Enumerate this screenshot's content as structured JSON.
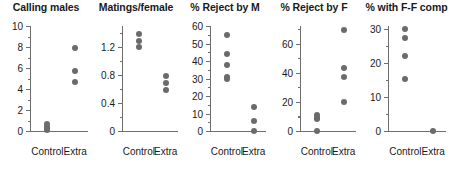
{
  "figure": {
    "background": "#ffffff",
    "point_color": "#6b6b6b",
    "axis_color": "#6e6e6e",
    "text_color": "#1a1a1a"
  },
  "group_labels": {
    "control": "Control",
    "extra": "Extra"
  },
  "chart_data": [
    {
      "type": "scatter",
      "title": "Calling males",
      "xlabel": "",
      "ylabel": "",
      "categories": [
        "Control",
        "Extra"
      ],
      "ylim": [
        0,
        10
      ],
      "yticks": [
        0,
        2,
        4,
        6,
        8,
        10
      ],
      "ytick_labels": [
        "0",
        "2",
        "4",
        "6",
        "8",
        "10"
      ],
      "yminor": [
        1,
        3,
        5,
        7,
        9
      ],
      "grid": false,
      "legend": "none",
      "series": [
        {
          "name": "Control",
          "values": [
            0.65,
            0.4,
            0.2,
            0.05
          ]
        },
        {
          "name": "Extra",
          "values": [
            7.9,
            5.7,
            4.7
          ]
        }
      ]
    },
    {
      "type": "scatter",
      "title": "Matings/female",
      "xlabel": "",
      "ylabel": "",
      "categories": [
        "Control",
        "Extra"
      ],
      "ylim": [
        0,
        1.5
      ],
      "yticks": [
        0,
        0.4,
        0.8,
        1.2
      ],
      "ytick_labels": [
        "0",
        "0.4",
        "0.8",
        "1.2"
      ],
      "yminor": [
        0.2,
        0.6,
        1.0,
        1.4
      ],
      "grid": false,
      "legend": "none",
      "series": [
        {
          "name": "Control",
          "values": [
            1.38,
            1.29,
            1.2
          ]
        },
        {
          "name": "Extra",
          "values": [
            0.79,
            0.69,
            0.59
          ]
        }
      ]
    },
    {
      "type": "scatter",
      "title": "% Reject by M",
      "xlabel": "",
      "ylabel": "",
      "categories": [
        "Control",
        "Extra"
      ],
      "ylim": [
        0,
        60
      ],
      "yticks": [
        0,
        10,
        20,
        30,
        40,
        50,
        60
      ],
      "ytick_labels": [
        "0",
        "10",
        "20",
        "30",
        "40",
        "50",
        "60"
      ],
      "yminor": [
        5,
        15,
        25,
        35,
        45,
        55
      ],
      "grid": false,
      "legend": "none",
      "series": [
        {
          "name": "Control",
          "values": [
            55,
            44,
            38,
            31,
            30
          ]
        },
        {
          "name": "Extra",
          "values": [
            14,
            6,
            0
          ]
        }
      ]
    },
    {
      "type": "scatter",
      "title": "% Reject by F",
      "xlabel": "",
      "ylabel": "",
      "categories": [
        "Control",
        "Extra"
      ],
      "ylim": [
        0,
        72
      ],
      "yticks": [
        0,
        20,
        40,
        60
      ],
      "ytick_labels": [
        "0",
        "20",
        "40",
        "60"
      ],
      "yminor": [
        10,
        30,
        50,
        70
      ],
      "grid": false,
      "legend": "none",
      "series": [
        {
          "name": "Control",
          "values": [
            11,
            9,
            8,
            0
          ]
        },
        {
          "name": "Extra",
          "values": [
            69,
            43,
            37,
            20
          ]
        }
      ]
    },
    {
      "type": "scatter",
      "title": "% with F-F comp",
      "xlabel": "",
      "ylabel": "",
      "categories": [
        "Control",
        "Extra"
      ],
      "ylim": [
        0,
        31
      ],
      "yticks": [
        0,
        10,
        20,
        30
      ],
      "ytick_labels": [
        "0",
        "10",
        "20",
        "30"
      ],
      "yminor": [
        5,
        15,
        25
      ],
      "grid": false,
      "legend": "none",
      "series": [
        {
          "name": "Control",
          "values": [
            30,
            27.5,
            22,
            15.5
          ]
        },
        {
          "name": "Extra",
          "values": [
            0
          ]
        }
      ]
    }
  ]
}
